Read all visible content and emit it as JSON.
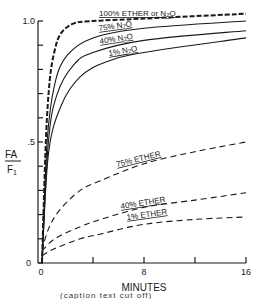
{
  "chart_data": {
    "type": "line",
    "title": "",
    "xlabel": "MINUTES",
    "ylabel_numerator": "FA",
    "ylabel_denominator": "F1",
    "ylabel": "FA/F1",
    "xlim": [
      0,
      16
    ],
    "ylim": [
      0,
      1.0
    ],
    "x_ticks": [
      0,
      4,
      8,
      12,
      16
    ],
    "x_tick_labels": [
      "0",
      "",
      "8",
      "",
      "16"
    ],
    "y_ticks": [
      0,
      0.1,
      0.2,
      0.3,
      0.4,
      0.5,
      0.6,
      0.7,
      0.8,
      0.9,
      1.0
    ],
    "y_tick_labels": {
      "0": "0",
      "0.5": ".5",
      "1.0": "1.0"
    },
    "grid": false,
    "legend": "inline labels on curves",
    "series": [
      {
        "name": "100% ETHER or N2O",
        "style": "dashed-heavy",
        "points": [
          [
            0,
            0
          ],
          [
            0.3,
            0.5
          ],
          [
            0.6,
            0.75
          ],
          [
            1,
            0.88
          ],
          [
            1.5,
            0.95
          ],
          [
            2.5,
            0.99
          ],
          [
            4,
            1.0
          ],
          [
            8,
            1.01
          ],
          [
            16,
            1.03
          ]
        ]
      },
      {
        "name": "75% N2O",
        "style": "solid",
        "points": [
          [
            0,
            0
          ],
          [
            0.4,
            0.5
          ],
          [
            1,
            0.74
          ],
          [
            2,
            0.86
          ],
          [
            4,
            0.93
          ],
          [
            8,
            0.97
          ],
          [
            16,
            1.0
          ]
        ]
      },
      {
        "name": "40% N2O",
        "style": "solid",
        "points": [
          [
            0,
            0
          ],
          [
            0.5,
            0.5
          ],
          [
            1.2,
            0.7
          ],
          [
            2.5,
            0.82
          ],
          [
            4,
            0.87
          ],
          [
            8,
            0.92
          ],
          [
            16,
            0.96
          ]
        ]
      },
      {
        "name": "1% N2O",
        "style": "solid",
        "points": [
          [
            0,
            0
          ],
          [
            0.5,
            0.45
          ],
          [
            1.5,
            0.65
          ],
          [
            3,
            0.77
          ],
          [
            5,
            0.83
          ],
          [
            8,
            0.87
          ],
          [
            16,
            0.93
          ]
        ]
      },
      {
        "name": "75% ETHER",
        "style": "dashed",
        "points": [
          [
            0,
            0.05
          ],
          [
            0.5,
            0.14
          ],
          [
            1.4,
            0.22
          ],
          [
            3,
            0.3
          ],
          [
            4.6,
            0.34
          ],
          [
            8,
            0.41
          ],
          [
            12,
            0.46
          ],
          [
            16,
            0.5
          ]
        ]
      },
      {
        "name": "40% ETHER",
        "style": "dashed",
        "points": [
          [
            0,
            0.05
          ],
          [
            1,
            0.1
          ],
          [
            3,
            0.15
          ],
          [
            4.6,
            0.18
          ],
          [
            8,
            0.23
          ],
          [
            12,
            0.26
          ],
          [
            16,
            0.29
          ]
        ]
      },
      {
        "name": "1% ETHER",
        "style": "dashed",
        "points": [
          [
            0,
            0.03
          ],
          [
            1,
            0.06
          ],
          [
            3,
            0.1
          ],
          [
            4.6,
            0.12
          ],
          [
            8,
            0.16
          ],
          [
            12,
            0.18
          ],
          [
            16,
            0.19
          ]
        ]
      }
    ],
    "annotations": [
      {
        "text": "100% ETHER or N2O",
        "x": 99,
        "y": 16,
        "rotate": 0
      },
      {
        "text": "75% N2O",
        "x": 99,
        "y": 31,
        "rotate": -8
      },
      {
        "text": "40% N2O",
        "x": 100,
        "y": 44,
        "rotate": -9
      },
      {
        "text": "1% N2O",
        "x": 109,
        "y": 56,
        "rotate": -10
      },
      {
        "text": "75% ETHER",
        "x": 117,
        "y": 167,
        "rotate": -14
      },
      {
        "text": "40% ETHER",
        "x": 121,
        "y": 209,
        "rotate": -9
      },
      {
        "text": "1% ETHER",
        "x": 127,
        "y": 220,
        "rotate": -8
      }
    ]
  },
  "axes": {
    "origin_label_y": "0",
    "origin_label_x": "0"
  },
  "caption": "(caption text cut off)"
}
